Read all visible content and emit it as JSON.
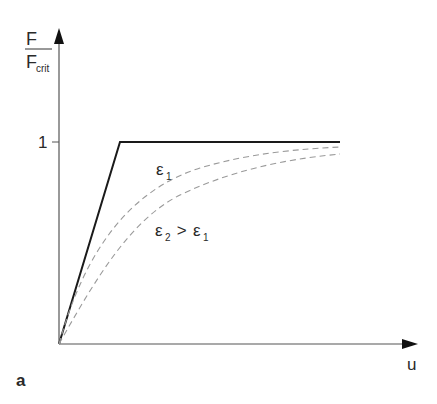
{
  "figure": {
    "panel_label": "a",
    "y_axis": {
      "label_numerator": "F",
      "label_denominator": "F",
      "label_denominator_sub": "crit",
      "tick_label": "1"
    },
    "x_axis": {
      "label": "u"
    },
    "curves": [
      {
        "name": "ideal",
        "style": "solid",
        "color": "#1a1a1a"
      },
      {
        "name": "epsilon1",
        "style": "dashed",
        "color": "#999999",
        "label": "ε",
        "label_sub": "1"
      },
      {
        "name": "epsilon2",
        "style": "dashed",
        "color": "#999999",
        "label": "ε",
        "label_sub": "2",
        "relation": " > ",
        "label2": "ε",
        "label2_sub": "1"
      }
    ]
  }
}
